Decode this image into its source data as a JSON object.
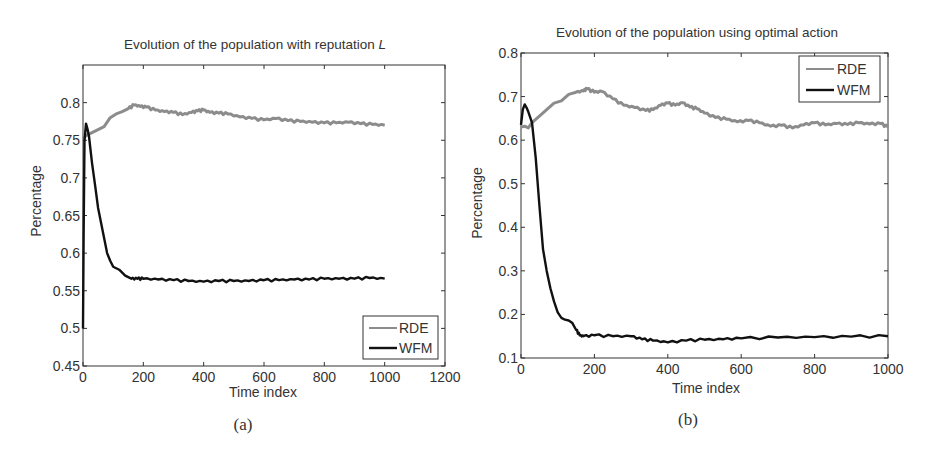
{
  "colors": {
    "rde": "#8c8c8c",
    "wfm": "#111111",
    "axis": "#333333"
  },
  "chart_data": [
    {
      "id": "a",
      "type": "line",
      "title": "Evolution of the population with reputation L",
      "title_main": "Evolution of the population with reputation ",
      "title_italic": "L",
      "xlabel": "Time index",
      "ylabel": "Percentage",
      "caption": "(a)",
      "xlim": [
        0,
        1200
      ],
      "ylim": [
        0.45,
        0.85
      ],
      "xticks": [
        0,
        200,
        400,
        600,
        800,
        1000,
        1200
      ],
      "xtick_labels": [
        "0",
        "200",
        "400",
        "600",
        "800",
        "1000",
        "1200"
      ],
      "yticks": [
        0.45,
        0.5,
        0.55,
        0.6,
        0.65,
        0.7,
        0.75,
        0.8
      ],
      "ytick_labels": [
        "0.45",
        "0.5",
        "0.55",
        "0.6",
        "0.65",
        "0.7",
        "0.75",
        "0.8"
      ],
      "grid": false,
      "legend_position": "lower right",
      "legend": [
        "RDE",
        "WFM"
      ],
      "series": [
        {
          "name": "RDE",
          "x": [
            0,
            10,
            30,
            50,
            70,
            90,
            110,
            130,
            150,
            170,
            190,
            210,
            240,
            270,
            300,
            330,
            360,
            380,
            400,
            420,
            450,
            480,
            520,
            560,
            600,
            640,
            680,
            720,
            760,
            800,
            840,
            880,
            920,
            960,
            1000
          ],
          "y": [
            0.752,
            0.756,
            0.76,
            0.764,
            0.768,
            0.78,
            0.785,
            0.788,
            0.792,
            0.797,
            0.795,
            0.794,
            0.79,
            0.788,
            0.787,
            0.784,
            0.787,
            0.789,
            0.79,
            0.787,
            0.786,
            0.785,
            0.781,
            0.779,
            0.777,
            0.779,
            0.776,
            0.775,
            0.774,
            0.773,
            0.773,
            0.774,
            0.772,
            0.771,
            0.77
          ]
        },
        {
          "name": "WFM",
          "x": [
            0,
            2,
            5,
            10,
            15,
            20,
            30,
            40,
            50,
            60,
            70,
            80,
            90,
            100,
            120,
            140,
            160,
            180,
            200,
            250,
            300,
            350,
            400,
            450,
            500,
            550,
            600,
            650,
            700,
            750,
            800,
            850,
            900,
            950,
            1000
          ],
          "y": [
            0.5,
            0.62,
            0.75,
            0.772,
            0.765,
            0.755,
            0.72,
            0.69,
            0.66,
            0.64,
            0.62,
            0.6,
            0.59,
            0.582,
            0.578,
            0.57,
            0.566,
            0.566,
            0.566,
            0.565,
            0.564,
            0.563,
            0.562,
            0.563,
            0.563,
            0.563,
            0.564,
            0.564,
            0.565,
            0.565,
            0.566,
            0.566,
            0.566,
            0.567,
            0.566
          ]
        }
      ]
    },
    {
      "id": "b",
      "type": "line",
      "title": "Evolution of the population using optimal action",
      "title_main": "Evolution of the population using optimal action",
      "title_italic": "",
      "xlabel": "Time index",
      "ylabel": "Percentage",
      "caption": "(b)",
      "xlim": [
        0,
        1000
      ],
      "ylim": [
        0.1,
        0.8
      ],
      "xticks": [
        0,
        200,
        400,
        600,
        800,
        1000
      ],
      "xtick_labels": [
        "0",
        "200",
        "400",
        "600",
        "800",
        "1000"
      ],
      "yticks": [
        0.1,
        0.2,
        0.3,
        0.4,
        0.5,
        0.6,
        0.7,
        0.8
      ],
      "ytick_labels": [
        "0.1",
        "0.2",
        "0.3",
        "0.4",
        "0.5",
        "0.6",
        "0.7",
        "0.8"
      ],
      "grid": false,
      "legend_position": "upper right",
      "legend": [
        "RDE",
        "WFM"
      ],
      "series": [
        {
          "name": "RDE",
          "x": [
            0,
            10,
            20,
            30,
            50,
            70,
            90,
            110,
            130,
            150,
            170,
            180,
            200,
            220,
            250,
            280,
            310,
            340,
            360,
            380,
            400,
            420,
            440,
            460,
            480,
            500,
            530,
            560,
            590,
            620,
            650,
            680,
            710,
            740,
            770,
            800,
            830,
            860,
            890,
            920,
            950,
            980,
            1000
          ],
          "y": [
            0.63,
            0.632,
            0.628,
            0.64,
            0.655,
            0.67,
            0.685,
            0.69,
            0.705,
            0.71,
            0.713,
            0.718,
            0.71,
            0.712,
            0.695,
            0.68,
            0.675,
            0.668,
            0.67,
            0.68,
            0.685,
            0.68,
            0.686,
            0.676,
            0.672,
            0.662,
            0.652,
            0.648,
            0.642,
            0.645,
            0.64,
            0.632,
            0.634,
            0.628,
            0.635,
            0.64,
            0.635,
            0.638,
            0.636,
            0.64,
            0.637,
            0.638,
            0.63
          ]
        },
        {
          "name": "WFM",
          "x": [
            0,
            5,
            10,
            15,
            20,
            30,
            40,
            50,
            60,
            70,
            80,
            90,
            100,
            110,
            120,
            130,
            140,
            150,
            160,
            170,
            200,
            250,
            300,
            330,
            360,
            400,
            450,
            500,
            550,
            600,
            700,
            800,
            900,
            1000
          ],
          "y": [
            0.635,
            0.67,
            0.682,
            0.675,
            0.665,
            0.64,
            0.56,
            0.45,
            0.35,
            0.3,
            0.26,
            0.23,
            0.205,
            0.192,
            0.188,
            0.186,
            0.18,
            0.165,
            0.152,
            0.15,
            0.152,
            0.15,
            0.15,
            0.143,
            0.14,
            0.136,
            0.14,
            0.142,
            0.143,
            0.145,
            0.147,
            0.148,
            0.149,
            0.15
          ]
        }
      ]
    }
  ]
}
